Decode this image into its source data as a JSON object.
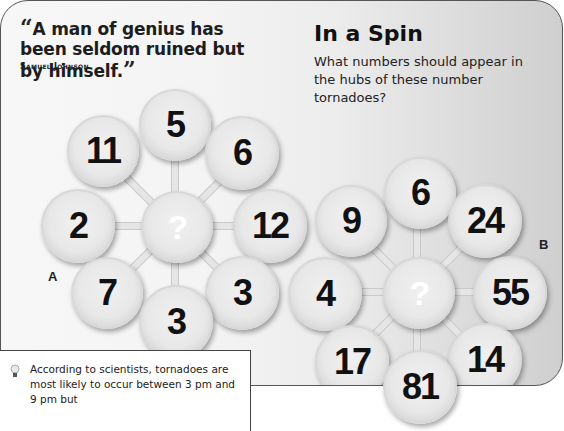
{
  "quote": {
    "open_mark": "“",
    "text": "A man of genius has been seldom ruined but by himself.",
    "close_mark": "”",
    "author": "Samuel Johnson"
  },
  "puzzle": {
    "title": "In a Spin",
    "question": "What numbers should appear in the hubs of these number tornadoes?",
    "tornado_a": {
      "label": "A",
      "hub": "?",
      "spokes": [
        "5",
        "6",
        "12",
        "3",
        "3",
        "7",
        "2",
        "11"
      ]
    },
    "tornado_b": {
      "label": "B",
      "hub": "?",
      "spokes": [
        "6",
        "24",
        "55",
        "14",
        "81",
        "17",
        "4",
        "9"
      ]
    }
  },
  "fact": {
    "icon": "lightbulb-icon",
    "text": "According to scientists, tornadoes are most likely to occur between 3 pm and 9 pm but"
  }
}
